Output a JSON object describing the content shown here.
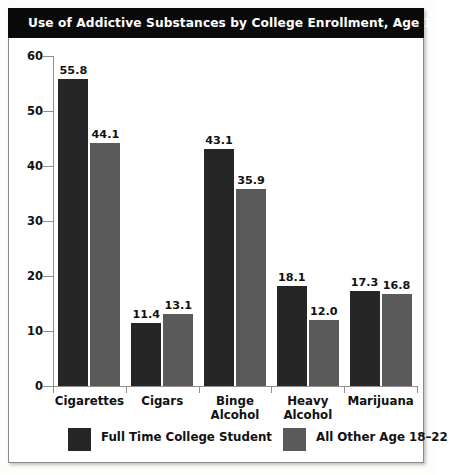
{
  "chart_data": {
    "type": "bar",
    "title": "Use of Addictive Substances by College Enrollment, Age 18–22, 1999",
    "xlabel": "",
    "ylabel": "",
    "ylim": [
      0,
      60
    ],
    "yticks": [
      0,
      10,
      20,
      30,
      40,
      50,
      60
    ],
    "ytick_labels": [
      "0",
      "10",
      "20",
      "30",
      "40",
      "50",
      "60"
    ],
    "grid": false,
    "legend_position": "bottom",
    "categories": [
      "Cigarettes",
      "Cigars",
      "Binge Alcohol",
      "Heavy Alcohol",
      "Marijuana"
    ],
    "category_lines": [
      [
        "Cigarettes"
      ],
      [
        "Cigars"
      ],
      [
        "Binge",
        "Alcohol"
      ],
      [
        "Heavy",
        "Alcohol"
      ],
      [
        "Marijuana"
      ]
    ],
    "series": [
      {
        "name": "Full Time College Student",
        "color": "#262626",
        "values": [
          55.8,
          11.4,
          43.1,
          18.1,
          17.3
        ],
        "value_labels": [
          "55.8",
          "11.4",
          "43.1",
          "18.1",
          "17.3"
        ]
      },
      {
        "name": "All Other Age 18–22",
        "color": "#5a5a5a",
        "values": [
          44.1,
          13.1,
          35.9,
          12.0,
          16.8
        ],
        "value_labels": [
          "44.1",
          "13.1",
          "35.9",
          "12.0",
          "16.8"
        ]
      }
    ]
  }
}
